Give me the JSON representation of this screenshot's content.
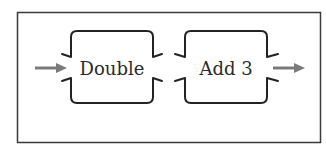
{
  "diagram": {
    "type": "function-machine-chain",
    "frame": {
      "stroke": "#3a3a3a"
    },
    "colors": {
      "box_stroke": "#222222",
      "arrow": "#7a7a7a",
      "text": "#2a2a2a",
      "background": "#ffffff"
    },
    "input_arrow": {
      "icon": "arrow-right-icon"
    },
    "machines": [
      {
        "label": "Double"
      },
      {
        "label": "Add 3"
      }
    ],
    "output_arrow": {
      "icon": "arrow-right-icon"
    }
  }
}
